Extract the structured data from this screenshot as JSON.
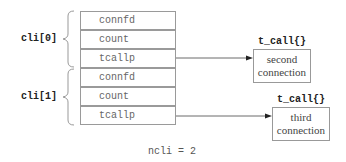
{
  "diagram": {
    "groups": [
      {
        "label": "cli[0]",
        "fields": [
          "connfd",
          "count",
          "tcallp"
        ]
      },
      {
        "label": "cli[1]",
        "fields": [
          "connfd",
          "count",
          "tcallp"
        ]
      }
    ],
    "targets": [
      {
        "type_label": "t_call{}",
        "line1": "second",
        "line2": "connection"
      },
      {
        "type_label": "t_call{}",
        "line1": "third",
        "line2": "connection"
      }
    ],
    "footer": "ncli = 2",
    "colors": {
      "border": "#9a9a9a",
      "text": "#666666",
      "label": "#222222"
    }
  }
}
